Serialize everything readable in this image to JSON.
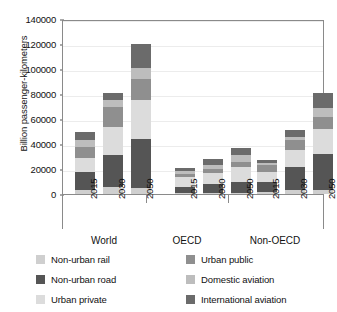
{
  "chart_data": {
    "type": "bar",
    "stacked": true,
    "title": "",
    "subtitle": "",
    "xlabel": "",
    "ylabel": "Billion passenger-kilometers",
    "ylim": [
      0,
      140000
    ],
    "ytick_labels": [
      "0",
      "20000",
      "40000",
      "60000",
      "80000",
      "100000",
      "120000",
      "140000"
    ],
    "ytick_values": [
      0,
      20000,
      40000,
      60000,
      80000,
      100000,
      120000,
      140000
    ],
    "grid": true,
    "legend_position": "bottom",
    "groups": [
      "World",
      "OECD",
      "Non-OECD"
    ],
    "categories": [
      "2015",
      "2030",
      "2050",
      "2015",
      "2030",
      "2050",
      "2015",
      "2030",
      "2050"
    ],
    "x": [
      {
        "group": "World",
        "year": "2015"
      },
      {
        "group": "World",
        "year": "2030"
      },
      {
        "group": "World",
        "year": "2050"
      },
      {
        "group": "OECD",
        "year": "2015"
      },
      {
        "group": "OECD",
        "year": "2030"
      },
      {
        "group": "OECD",
        "year": "2050"
      },
      {
        "group": "Non-OECD",
        "year": "2015"
      },
      {
        "group": "Non-OECD",
        "year": "2030"
      },
      {
        "group": "Non-OECD",
        "year": "2050"
      }
    ],
    "series": [
      {
        "name": "Non-urban rail",
        "color": "#cfcfcf",
        "values": [
          3000,
          5500,
          5000,
          500,
          600,
          700,
          2000,
          3000,
          3500
        ]
      },
      {
        "name": "Non-urban road",
        "color": "#555555",
        "values": [
          15000,
          25500,
          39000,
          5500,
          7400,
          9300,
          7500,
          18500,
          28500
        ]
      },
      {
        "name": "Urban private",
        "color": "#dcdcdc",
        "values": [
          11000,
          23000,
          31000,
          7500,
          9000,
          12000,
          8000,
          14000,
          20000
        ]
      },
      {
        "name": "Urban public",
        "color": "#8f8f8f",
        "values": [
          9000,
          16000,
          17000,
          2500,
          3000,
          4000,
          5500,
          7500,
          10000
        ]
      },
      {
        "name": "Domestic aviation",
        "color": "#bdbdbd",
        "values": [
          5000,
          5000,
          9000,
          2500,
          3500,
          5000,
          1500,
          3000,
          7000
        ]
      },
      {
        "name": "International aviation",
        "color": "#6b6b6b",
        "values": [
          7000,
          6000,
          19000,
          2500,
          4500,
          6000,
          2500,
          5000,
          12000
        ]
      }
    ],
    "totals": [
      50000,
      81000,
      120000,
      21000,
      28000,
      37000,
      27000,
      51000,
      81000
    ]
  },
  "legend": {
    "items": [
      {
        "label": "Non-urban rail",
        "color": "#cfcfcf"
      },
      {
        "label": "Non-urban road",
        "color": "#555555"
      },
      {
        "label": "Urban private",
        "color": "#dcdcdc"
      },
      {
        "label": "Urban public",
        "color": "#8f8f8f"
      },
      {
        "label": "Domestic aviation",
        "color": "#bdbdbd"
      },
      {
        "label": "International aviation",
        "color": "#6b6b6b"
      }
    ]
  },
  "colors": {
    "axis": "#8a8a8a",
    "grid": "#ececec",
    "text": "#111111",
    "background": "#ffffff"
  }
}
